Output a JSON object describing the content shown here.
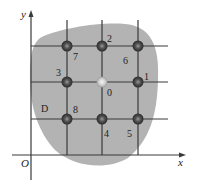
{
  "diagram": {
    "type": "grid-stencil",
    "region_label": "D",
    "axes": {
      "x_label": "x",
      "y_label": "y",
      "origin_label": "O"
    },
    "colors": {
      "region_fill": "#b3b3b3",
      "grid_line": "#3a3a3a",
      "node_dark": "#3c3c3c",
      "node_center": "#d0d0d0",
      "text": "#222222"
    },
    "nodes": [
      {
        "id": "0",
        "label": "0",
        "col": 1,
        "row": 1,
        "center": true
      },
      {
        "id": "1",
        "label": "1",
        "col": 2,
        "row": 1
      },
      {
        "id": "2",
        "label": "2",
        "col": 1,
        "row": 0
      },
      {
        "id": "3",
        "label": "3",
        "col": 0,
        "row": 1
      },
      {
        "id": "4",
        "label": "4",
        "col": 1,
        "row": 2
      },
      {
        "id": "5",
        "label": "5",
        "col": 2,
        "row": 2
      },
      {
        "id": "6",
        "label": "6",
        "col": 2,
        "row": 0
      },
      {
        "id": "7",
        "label": "7",
        "col": 0,
        "row": 0
      },
      {
        "id": "8",
        "label": "8",
        "col": 0,
        "row": 2
      }
    ]
  }
}
